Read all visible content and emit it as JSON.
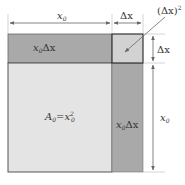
{
  "diagram": {
    "type": "geometric-area-decomposition",
    "colors": {
      "main_square": "#e4e4e4",
      "strips": "#a9a9a9",
      "corner_square": "#d2d2d2",
      "stroke": "#555555",
      "arrow": "#666666"
    },
    "labels": {
      "top_width_x0": "x",
      "top_width_x0_sub": "0",
      "top_width_dx": "Δx",
      "corner": "(Δx)",
      "corner_sup": "2",
      "right_height_dx": "Δx",
      "right_height_x0": "x",
      "right_height_x0_sub": "0",
      "top_strip_x": "x",
      "top_strip_sub": "0",
      "top_strip_dx": "Δx",
      "side_strip_x": "x",
      "side_strip_sub": "0",
      "side_strip_dx": "Δx",
      "main_A": "A",
      "main_A_sub": "0",
      "main_eq": "=",
      "main_x": "x",
      "main_x_sub": "0",
      "main_x_sup": "2"
    }
  }
}
